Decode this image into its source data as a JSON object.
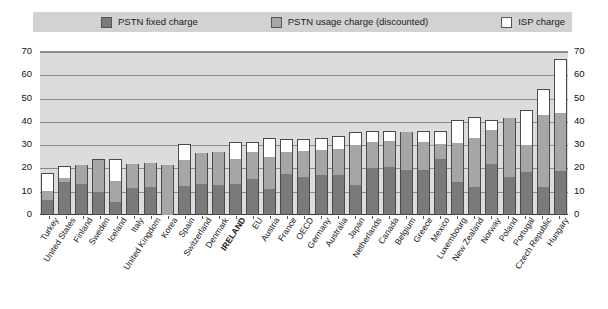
{
  "legend": {
    "items": [
      {
        "label": "PSTN fixed charge",
        "color": "#7a7a7a",
        "name": "legend-pstn-fixed"
      },
      {
        "label": "PSTN usage charge (discounted)",
        "color": "#a6a6a6",
        "name": "legend-pstn-usage"
      },
      {
        "label": "ISP charge",
        "color": "#ffffff",
        "name": "legend-isp"
      }
    ]
  },
  "chart_data": {
    "type": "bar",
    "stacked": true,
    "title": "",
    "subtitle": "",
    "xlabel": "",
    "ylabel": "",
    "ylim": [
      0,
      70
    ],
    "yticks": [
      0,
      10,
      20,
      30,
      40,
      50,
      60,
      70
    ],
    "grid": true,
    "legend_position": "top",
    "dual_y_axis": true,
    "highlighted_category": "IRELAND",
    "categories": [
      "Turkey",
      "United States",
      "Finland",
      "Sweden",
      "Iceland",
      "Italy",
      "United Kingdom",
      "Korea",
      "Spain",
      "Switzerland",
      "Denmark",
      "IRELAND",
      "EU",
      "Austria",
      "France",
      "OECD",
      "Germany",
      "Australia",
      "Japan",
      "Netherlands",
      "Canada",
      "Belgium",
      "Greece",
      "Mexico",
      "Luxembourg",
      "New Zealand",
      "Norway",
      "Poland",
      "Portugal",
      "Czech Republic",
      "Hungary"
    ],
    "series": [
      {
        "name": "PSTN fixed charge",
        "color": "#7a7a7a",
        "values": [
          6.5,
          14.0,
          13.5,
          10.0,
          5.5,
          11.5,
          12.0,
          0.0,
          12.5,
          13.5,
          13.0,
          13.5,
          15.5,
          11.0,
          17.5,
          16.5,
          17.0,
          17.0,
          13.0,
          20.0,
          20.5,
          19.5,
          19.5,
          24.0,
          14.0,
          12.0,
          22.0,
          16.5,
          18.5,
          12.0,
          19.0
        ]
      },
      {
        "name": "PSTN usage charge (discounted)",
        "color": "#a6a6a6",
        "values": [
          4.0,
          2.0,
          8.0,
          13.5,
          9.0,
          10.5,
          10.5,
          21.5,
          11.0,
          13.0,
          14.0,
          10.5,
          11.5,
          14.0,
          9.5,
          11.0,
          11.0,
          11.5,
          17.0,
          11.5,
          11.5,
          16.0,
          12.0,
          6.5,
          17.0,
          21.0,
          14.5,
          25.0,
          11.5,
          31.0,
          25.0
        ]
      },
      {
        "name": "ISP charge",
        "color": "#ffffff",
        "values": [
          7.5,
          5.0,
          0.0,
          0.5,
          9.5,
          0.0,
          0.0,
          0.0,
          7.0,
          0.0,
          0.0,
          7.5,
          4.5,
          8.0,
          5.5,
          5.0,
          5.0,
          5.5,
          5.5,
          4.5,
          4.0,
          0.0,
          4.5,
          5.5,
          10.0,
          9.0,
          4.5,
          0.0,
          15.0,
          11.0,
          23.0
        ]
      }
    ],
    "totals": [
      18.0,
      21.0,
      21.5,
      24.0,
      24.0,
      22.0,
      22.5,
      21.5,
      30.5,
      26.5,
      27.0,
      31.5,
      31.5,
      33.0,
      32.5,
      32.5,
      33.0,
      34.0,
      35.5,
      36.0,
      36.0,
      35.5,
      36.0,
      36.0,
      41.0,
      42.0,
      41.0,
      41.5,
      45.0,
      54.0,
      67.0
    ]
  }
}
